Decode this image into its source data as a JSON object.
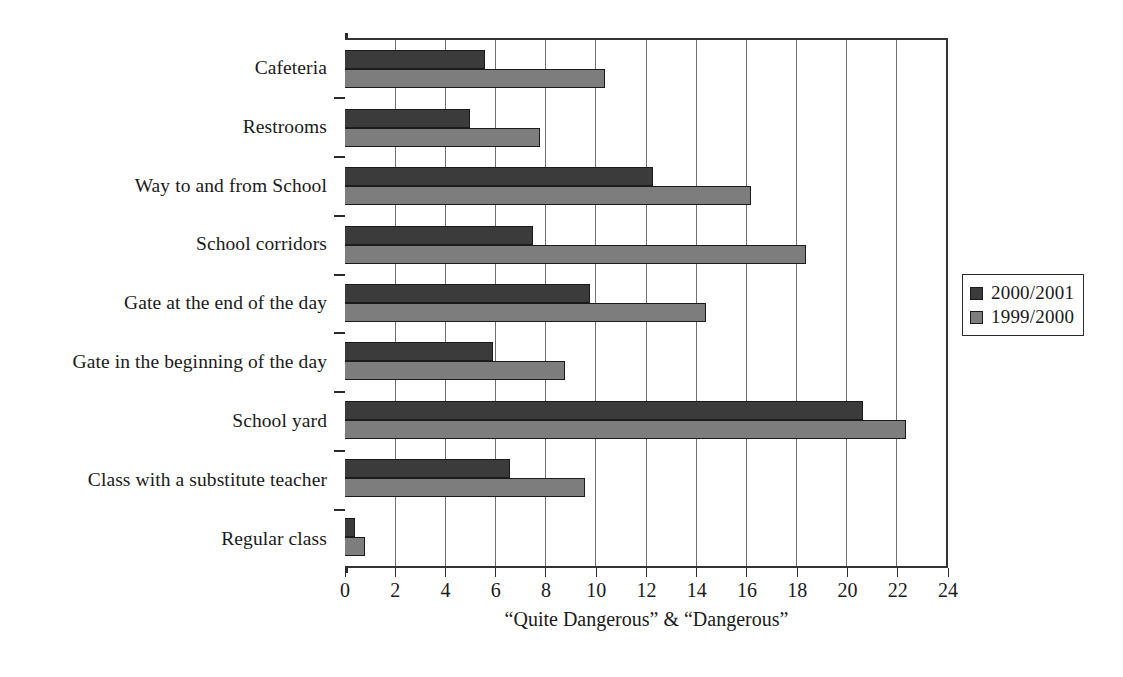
{
  "chart_data": {
    "type": "bar",
    "orientation": "horizontal",
    "title": "",
    "subtitle": "",
    "xlabel": "“Quite Dangerous” & “Dangerous”",
    "ylabel": "",
    "xlim": [
      0,
      24
    ],
    "xticks": [
      0,
      2,
      4,
      6,
      8,
      10,
      12,
      14,
      16,
      18,
      20,
      22,
      24
    ],
    "xtick_labels": [
      "0",
      "2",
      "4",
      "6",
      "8",
      "10",
      "12",
      "14",
      "16",
      "18",
      "20",
      "22",
      "24"
    ],
    "grid": "vertical",
    "legend_position": "right",
    "categories": [
      "Cafeteria",
      "Restrooms",
      "Way to and from School",
      "School corridors",
      "Gate at the end of the day",
      "Gate in the beginning of the day",
      "School yard",
      "Class with a substitute teacher",
      "Regular class"
    ],
    "series": [
      {
        "name": "2000/2001",
        "color": "#3b3b3b",
        "values": [
          5.6,
          5.0,
          12.3,
          7.5,
          9.8,
          5.9,
          20.7,
          6.6,
          0.4
        ]
      },
      {
        "name": "1999/2000",
        "color": "#7d7d7d",
        "values": [
          10.4,
          7.8,
          16.2,
          18.4,
          14.4,
          8.8,
          22.4,
          9.6,
          0.8
        ]
      }
    ]
  },
  "legend": {
    "entries": [
      {
        "label": "2000/2001",
        "color": "#3b3b3b"
      },
      {
        "label": "1999/2000",
        "color": "#7d7d7d"
      }
    ]
  },
  "axis": {
    "x_title": "“Quite Dangerous” & “Dangerous”"
  }
}
